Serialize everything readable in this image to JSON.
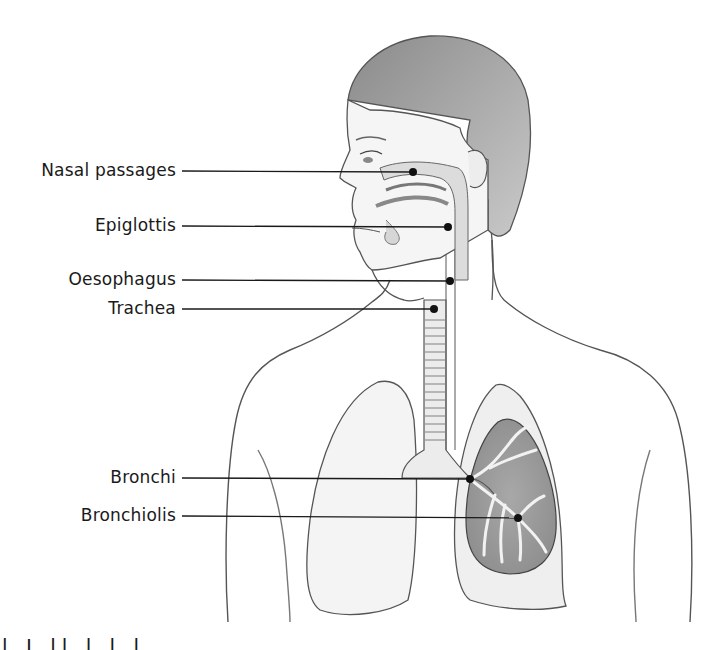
{
  "diagram": {
    "labels": [
      {
        "text": "Nasal passages",
        "y": 171,
        "dot_x": 413,
        "dot_y": 172
      },
      {
        "text": "Epiglottis",
        "y": 226,
        "dot_x": 448,
        "dot_y": 227
      },
      {
        "text": "Oesophagus",
        "y": 280,
        "dot_x": 450,
        "dot_y": 281
      },
      {
        "text": "Trachea",
        "y": 309,
        "dot_x": 434,
        "dot_y": 309
      },
      {
        "text": "Bronchi",
        "y": 478,
        "dot_x": 470,
        "dot_y": 479
      },
      {
        "text": "Bronchiolis",
        "y": 516,
        "dot_x": 518,
        "dot_y": 518
      }
    ],
    "leader_line_start_x": 182,
    "colors": {
      "ink": "#1a1a1a",
      "pencil": "#555555",
      "shade": "#9a9a9a",
      "lung_section": "#b8b8b8",
      "background": "#ffffff"
    },
    "caption_partial": "l I ll l l l"
  }
}
